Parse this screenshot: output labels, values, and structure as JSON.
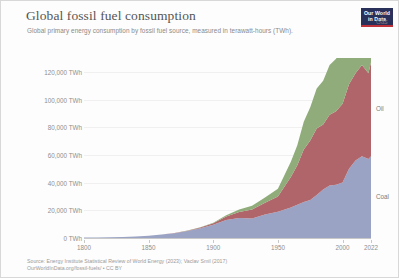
{
  "header": {
    "title": "Global fossil fuel consumption",
    "subtitle": "Global primary energy consumption by fossil fuel source, measured in terawatt-hours (TWh).",
    "logo_line1": "Our World",
    "logo_line2": "in Data",
    "logo_bg": "#29305a",
    "logo_rule": "#c0323a"
  },
  "footer": {
    "source": "Source: Energy Institute Statistical Review of World Energy (2023); Vaclav Smil (2017)",
    "license": "OurWorldInData.org/fossil-fuels/ • CC BY"
  },
  "chart_data": {
    "type": "area",
    "stacked": true,
    "title": "Global fossil fuel consumption",
    "subtitle": "Global primary energy consumption by fossil fuel source, measured in terawatt-hours (TWh).",
    "xlabel": "",
    "ylabel": "",
    "unit": "TWh",
    "xlim": [
      1800,
      2022
    ],
    "ylim": [
      0,
      130000
    ],
    "grid": true,
    "legend_position": "right-inline",
    "xticks": [
      1800,
      1850,
      1900,
      1950,
      2000,
      2022
    ],
    "xtick_labels": [
      "1800",
      "1850",
      "1900",
      "1950",
      "2000",
      "2022"
    ],
    "yticks": [
      0,
      20000,
      40000,
      60000,
      80000,
      100000,
      120000
    ],
    "ytick_labels": [
      "0 TWh",
      "20,000 TWh",
      "40,000 TWh",
      "60,000 TWh",
      "80,000 TWh",
      "100,000 TWh",
      "120,000 TWh"
    ],
    "x": [
      1800,
      1810,
      1820,
      1830,
      1840,
      1850,
      1860,
      1870,
      1880,
      1890,
      1900,
      1910,
      1920,
      1930,
      1940,
      1950,
      1960,
      1965,
      1970,
      1975,
      1980,
      1985,
      1990,
      1995,
      2000,
      2005,
      2010,
      2015,
      2020,
      2022
    ],
    "series": [
      {
        "name": "Coal",
        "label": "Coal",
        "color": "#9aa3c4",
        "values": [
          280,
          400,
          560,
          760,
          1100,
          1700,
          2500,
          3500,
          5000,
          7000,
          9500,
          13000,
          14500,
          14000,
          17000,
          19000,
          22000,
          24000,
          26000,
          27500,
          31000,
          35000,
          38000,
          38500,
          40000,
          50000,
          56000,
          59000,
          57000,
          59000
        ]
      },
      {
        "name": "Oil",
        "label": "Oil",
        "color": "#b0656a",
        "values": [
          0,
          0,
          0,
          0,
          0,
          0,
          30,
          120,
          300,
          600,
          1200,
          2600,
          4200,
          6500,
          8500,
          11000,
          22000,
          28500,
          38000,
          43000,
          48000,
          47000,
          51000,
          53000,
          57000,
          61000,
          63000,
          66000,
          62000,
          68000
        ]
      },
      {
        "name": "Gas",
        "label": "Gas",
        "color": "#8fac7a",
        "values": [
          0,
          0,
          0,
          0,
          0,
          0,
          0,
          0,
          50,
          150,
          400,
          900,
          1800,
          2800,
          3800,
          5500,
          11000,
          14500,
          20000,
          24000,
          29000,
          31500,
          36000,
          38000,
          42000,
          47000,
          51000,
          55000,
          56000,
          58000
        ]
      }
    ],
    "total_2022": 185000,
    "annotations": []
  }
}
